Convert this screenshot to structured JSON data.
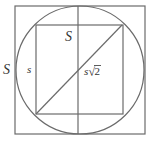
{
  "diagram": {
    "colors": {
      "line": "#6b6b6b",
      "text": "#333333",
      "background": "#ffffff"
    },
    "outer_square": {
      "x": 15,
      "y": 6,
      "w": 130,
      "h": 128
    },
    "circle": {
      "cx": 80,
      "cy": 70,
      "r": 64
    },
    "inner_square": {
      "x": 36,
      "y": 25,
      "w": 87,
      "h": 89
    },
    "center_vertical_line": {
      "x": 78,
      "y1": 6,
      "y2": 134
    },
    "diagonal": {
      "x1": 36,
      "y1": 114,
      "x2": 122,
      "y2": 25
    },
    "labels": {
      "outer_side": "S",
      "top_side": "S",
      "inner_side": "s",
      "diagonal_prefix": "s",
      "diagonal_radical": "√",
      "diagonal_number": "2"
    }
  }
}
